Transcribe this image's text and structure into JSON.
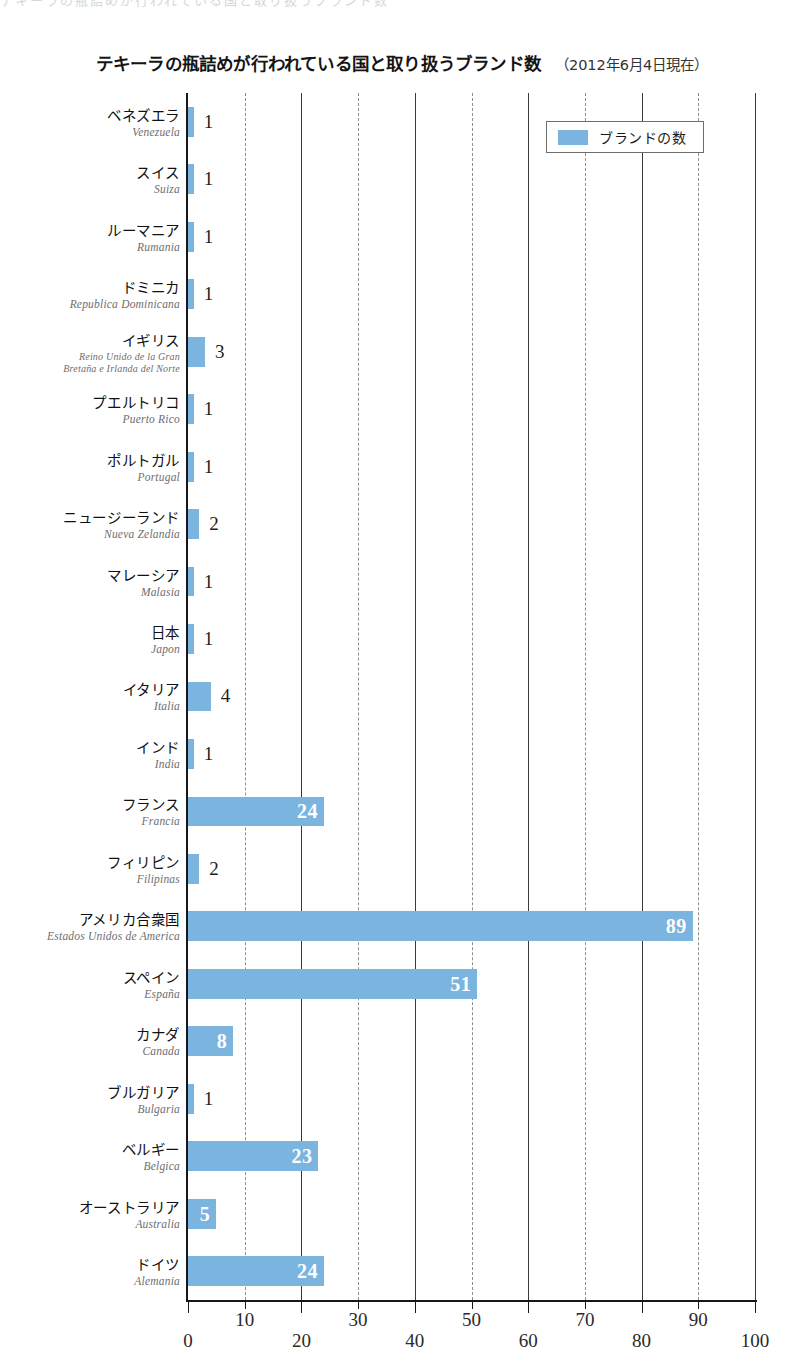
{
  "top_crop_text": "テキーラの瓶詰めが行われている国と取り扱うブランド数",
  "title": {
    "main": "テキーラの瓶詰めが行われている国と取り扱うブランド数",
    "note": "（2012年6月4日現在）"
  },
  "legend": {
    "label": "ブランドの数",
    "swatch_color": "#7cb4e0"
  },
  "axis": {
    "ticks": [
      "0",
      "10",
      "20",
      "30",
      "40",
      "50",
      "60",
      "70",
      "80",
      "90",
      "100"
    ]
  },
  "chart_data": {
    "type": "bar",
    "orientation": "horizontal",
    "title": "テキーラの瓶詰めが行われている国と取り扱うブランド数",
    "subtitle": "（2012年6月4日現在）",
    "xlabel": "",
    "ylabel": "",
    "xlim": [
      0,
      100
    ],
    "xticks": [
      0,
      10,
      20,
      30,
      40,
      50,
      60,
      70,
      80,
      90,
      100
    ],
    "grid": "vertical-dashed",
    "legend_position": "top-right",
    "series": [
      {
        "name": "ブランドの数",
        "color": "#7cb4e0",
        "values": [
          1,
          1,
          1,
          1,
          3,
          1,
          1,
          2,
          1,
          1,
          4,
          1,
          24,
          2,
          89,
          51,
          8,
          1,
          23,
          5,
          24
        ]
      }
    ],
    "categories": [
      "ベネズエラ",
      "スイス",
      "ルーマニア",
      "ドミニカ",
      "イギリス",
      "プエルトリコ",
      "ポルトガル",
      "ニュージーランド",
      "マレーシア",
      "日本",
      "イタリア",
      "インド",
      "フランス",
      "フィリピン",
      "アメリカ合衆国",
      "スペイン",
      "カナダ",
      "ブルガリア",
      "ベルギー",
      "オーストラリア",
      "ドイツ"
    ],
    "categories_es": [
      "Venezuela",
      "Suiza",
      "Rumania",
      "Republica Dominicana",
      "Reino Unido de la Gran Bretaña e Irlanda del Norte",
      "Puerto Rico",
      "Portugal",
      "Nueva Zelandia",
      "Malasia",
      "Japon",
      "Italia",
      "India",
      "Francia",
      "Filipinas",
      "Estados Unidos de America",
      "España",
      "Canada",
      "Bulgaria",
      "Belgica",
      "Australia",
      "Alemania"
    ]
  },
  "rows": [
    {
      "ja": "ベネズエラ",
      "es": "Venezuela",
      "es2": "",
      "value": 1,
      "label": "1"
    },
    {
      "ja": "スイス",
      "es": "Suiza",
      "es2": "",
      "value": 1,
      "label": "1"
    },
    {
      "ja": "ルーマニア",
      "es": "Rumania",
      "es2": "",
      "value": 1,
      "label": "1"
    },
    {
      "ja": "ドミニカ",
      "es": "Republica Dominicana",
      "es2": "",
      "value": 1,
      "label": "1"
    },
    {
      "ja": "イギリス",
      "es": "Reino Unido de la Gran",
      "es2": "Bretaña e Irlanda del Norte",
      "value": 3,
      "label": "3"
    },
    {
      "ja": "プエルトリコ",
      "es": "Puerto Rico",
      "es2": "",
      "value": 1,
      "label": "1"
    },
    {
      "ja": "ポルトガル",
      "es": "Portugal",
      "es2": "",
      "value": 1,
      "label": "1"
    },
    {
      "ja": "ニュージーランド",
      "es": "Nueva Zelandia",
      "es2": "",
      "value": 2,
      "label": "2"
    },
    {
      "ja": "マレーシア",
      "es": "Malasia",
      "es2": "",
      "value": 1,
      "label": "1"
    },
    {
      "ja": "日本",
      "es": "Japon",
      "es2": "",
      "value": 1,
      "label": "1"
    },
    {
      "ja": "イタリア",
      "es": "Italia",
      "es2": "",
      "value": 4,
      "label": "4"
    },
    {
      "ja": "インド",
      "es": "India",
      "es2": "",
      "value": 1,
      "label": "1"
    },
    {
      "ja": "フランス",
      "es": "Francia",
      "es2": "",
      "value": 24,
      "label": "24"
    },
    {
      "ja": "フィリピン",
      "es": "Filipinas",
      "es2": "",
      "value": 2,
      "label": "2"
    },
    {
      "ja": "アメリカ合衆国",
      "es": "Estados Unidos de America",
      "es2": "",
      "value": 89,
      "label": "89"
    },
    {
      "ja": "スペイン",
      "es": "España",
      "es2": "",
      "value": 51,
      "label": "51"
    },
    {
      "ja": "カナダ",
      "es": "Canada",
      "es2": "",
      "value": 8,
      "label": "8"
    },
    {
      "ja": "ブルガリア",
      "es": "Bulgaria",
      "es2": "",
      "value": 1,
      "label": "1"
    },
    {
      "ja": "ベルギー",
      "es": "Belgica",
      "es2": "",
      "value": 23,
      "label": "23"
    },
    {
      "ja": "オーストラリア",
      "es": "Australia",
      "es2": "",
      "value": 5,
      "label": "5"
    },
    {
      "ja": "ドイツ",
      "es": "Alemania",
      "es2": "",
      "value": 24,
      "label": "24"
    }
  ]
}
